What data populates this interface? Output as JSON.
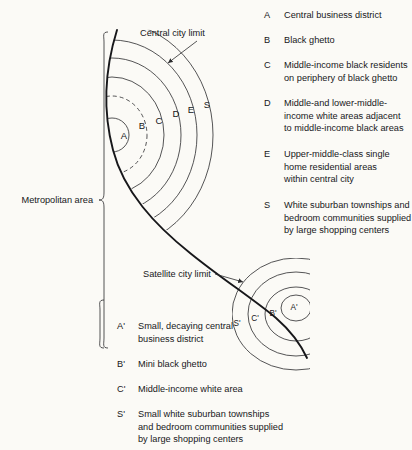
{
  "figure": {
    "background_color": "#fbfaf6",
    "line_color": "#2a2a2c"
  },
  "callouts": [
    {
      "name": "central-city-limit",
      "text": "Central city limit"
    },
    {
      "name": "satellite-city-limit",
      "text": "Satellite city limit"
    }
  ],
  "brackets": [
    {
      "name": "metropolitan-area",
      "label": "Metropolitan area"
    }
  ],
  "central_city": {
    "zone_letters": [
      "A",
      "B",
      "C",
      "D",
      "E",
      "S"
    ]
  },
  "satellite_city": {
    "zone_letters": [
      "A'",
      "B'",
      "C'",
      "S'"
    ]
  },
  "legend_top": [
    {
      "key": "A",
      "description": "Central business district"
    },
    {
      "key": "B",
      "description": "Black ghetto"
    },
    {
      "key": "C",
      "description": "Middle-income black residents\non periphery of black ghetto"
    },
    {
      "key": "D",
      "description": "Middle-and lower-middle-\nincome white areas adjacent\nto middle-income black areas"
    },
    {
      "key": "E",
      "description": "Upper-middle-class single\nhome residential areas\nwithin central city"
    },
    {
      "key": "S",
      "description": "White suburban townships and\nbedroom communities supplied\nby large shopping centers"
    }
  ],
  "legend_bottom": [
    {
      "key": "A'",
      "description": "Small, decaying central\nbusiness district"
    },
    {
      "key": "B'",
      "description": "Mini black ghetto"
    },
    {
      "key": "C'",
      "description": "Middle-income white area"
    },
    {
      "key": "S'",
      "description": "Small white suburban townships\nand bedroom communities supplied\nby large shopping centers"
    }
  ]
}
